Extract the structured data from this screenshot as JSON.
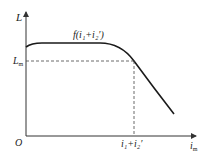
{
  "diagram": {
    "title": "",
    "y_axis_label": "L",
    "x_axis_label": "i",
    "x_axis_label_sub": "m",
    "origin_label": "O",
    "y_marker_label": "L",
    "y_marker_label_sub": "m",
    "curve_label": "f(i₁+i₂′)",
    "x_marker_label": "i₁+i₂′",
    "colors": {
      "curve": "#1a1a1a",
      "axis": "#333333",
      "dashed": "#444444"
    }
  }
}
